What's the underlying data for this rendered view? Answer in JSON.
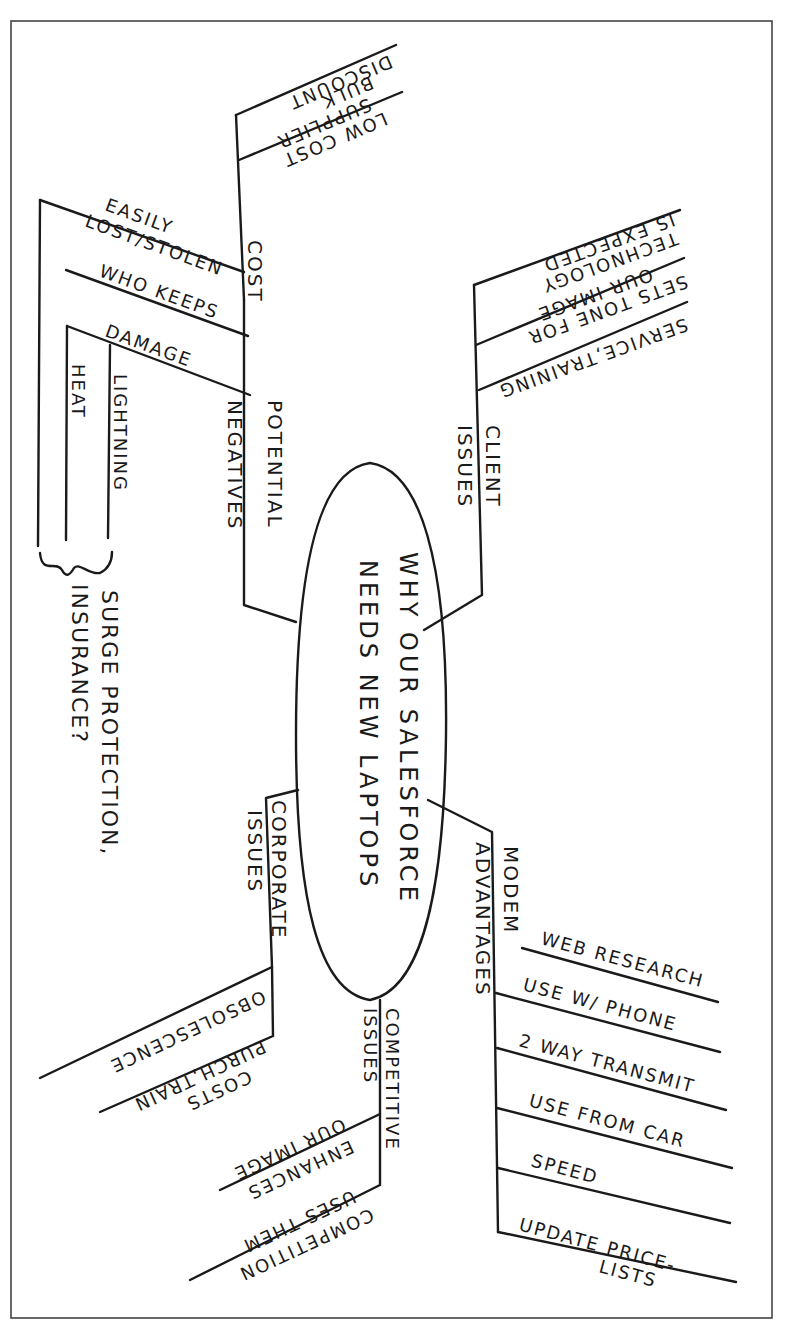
{
  "mindmap": {
    "center": {
      "line1": "WHY OUR SALESFORCE",
      "line2": "NEEDS NEW LAPTOPS"
    },
    "branches": {
      "cost": {
        "label": "COST",
        "items": [
          "DISCOUNT",
          "BULK",
          "SUPPLIER",
          "LOW COST"
        ]
      },
      "potential_negatives": {
        "label_line1": "POTENTIAL",
        "label_line2": "NEGATIVES",
        "items": [
          "EASILY",
          "LOST/STOLEN",
          "WHO KEEPS",
          "DAMAGE"
        ],
        "damage_subitems": [
          "LIGHTNING",
          "HEAT"
        ],
        "note_line1": "SURGE PROTECTION,",
        "note_line2": "INSURANCE?"
      },
      "client_issues": {
        "label_line1": "CLIENT",
        "label_line2": "ISSUES",
        "items": [
          "IS EXPECTED",
          "TECHNOLOGY",
          "OUR IMAGE",
          "SETS TONE FOR",
          "SERVICE,TRAINING"
        ]
      },
      "corporate_issues": {
        "label_line1": "CORPORATE",
        "label_line2": "ISSUES",
        "items": [
          "OBSOLESCENCE",
          "PURCH,TRAIN",
          "COSTS"
        ]
      },
      "competitive_issues": {
        "label_line1": "COMPETITIVE",
        "label_line2": "ISSUES",
        "items": [
          "OUR IMAGE",
          "ENHANCES",
          "USES THEM",
          "COMPETITION"
        ]
      },
      "modem_advantages": {
        "label_line1": "MODEM",
        "label_line2": "ADVANTAGES",
        "items": [
          "WEB RESEARCH",
          "USE W/ PHONE",
          "2 WAY TRANSMIT",
          "USE FROM CAR",
          "SPEED",
          "UPDATE PRICE-",
          "LISTS"
        ]
      }
    }
  }
}
